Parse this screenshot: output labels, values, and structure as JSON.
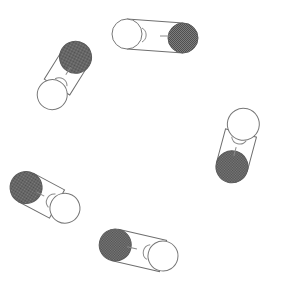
{
  "scene": {
    "title": "Dumbbell Objects Arrangement",
    "width": 289,
    "height": 297,
    "background_color": "#ffffff",
    "object_count": 6,
    "description": "Six dumbbell-shaped objects, each made of one white sphere and one dark shaded sphere joined by a cylindrical rod, arranged in a ring."
  },
  "palette": {
    "background": "#ffffff",
    "white_sphere_fill": "#ffffff",
    "white_sphere_stroke": "#777777",
    "dark_sphere_fill": "#6b6b6b",
    "dark_sphere_stroke": "#5a5a5a",
    "tube_fill": "#ffffff",
    "tube_stroke": "#6e6e6e",
    "rim_stroke": "#8a8a8a"
  },
  "objects": [
    {
      "id": "dumbbell-top",
      "label": "Top dumbbell",
      "white_sphere": {
        "cx": 127,
        "cy": 34,
        "r": 15
      },
      "dark_sphere": {
        "cx": 183,
        "cy": 38,
        "r": 15
      },
      "angle_deg": 4,
      "dark_end": "right"
    },
    {
      "id": "dumbbell-upper-left",
      "label": "Upper left dumbbell",
      "white_sphere": {
        "cx": 46,
        "cy": 105,
        "r": 15
      },
      "dark_sphere": {
        "cx": 68,
        "cy": 70,
        "r": 16
      },
      "angle_deg": -58,
      "dark_end": "upper-right"
    },
    {
      "id": "dumbbell-right",
      "label": "Right dumbbell",
      "white_sphere": {
        "cx": 248,
        "cy": 110,
        "r": 16
      },
      "dark_sphere": {
        "cx": 235,
        "cy": 157,
        "r": 16
      },
      "angle_deg": 74,
      "dark_end": "lower-left"
    },
    {
      "id": "dumbbell-lower-left",
      "label": "Lower left dumbbell",
      "white_sphere": {
        "cx": 76,
        "cy": 214,
        "r": 15
      },
      "dark_sphere": {
        "cx": 38,
        "cy": 194,
        "r": 16
      },
      "angle_deg": 28,
      "dark_end": "upper-left"
    },
    {
      "id": "dumbbell-bottom",
      "label": "Bottom dumbbell",
      "white_sphere": {
        "cx": 188,
        "cy": 250,
        "r": 15
      },
      "dark_sphere": {
        "cx": 139,
        "cy": 261,
        "r": 16
      },
      "angle_deg": -13,
      "dark_end": "left"
    },
    {
      "id": "dumbbell-far-right-top",
      "label": "Right upper sphere pair",
      "white_sphere": {
        "cx": 248,
        "cy": 110,
        "r": 16
      },
      "dark_sphere": {
        "cx": 235,
        "cy": 157,
        "r": 16
      },
      "angle_deg": 74,
      "dark_end": "lower-left"
    }
  ]
}
